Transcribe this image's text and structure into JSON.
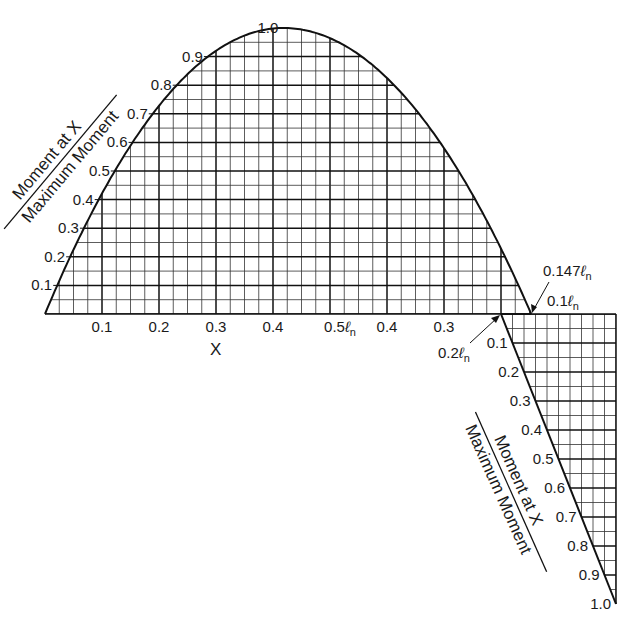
{
  "chart_data": {
    "type": "line",
    "title": "",
    "xlabel": "X",
    "ylabel": "Moment at X / Maximum Moment",
    "x_tick_labels": [
      "0.1",
      "0.2",
      "0.3",
      "0.4",
      "0.5ℓn",
      "0.4",
      "0.3"
    ],
    "y_tick_labels_positive": [
      "0.1",
      "0.2",
      "0.3",
      "0.4",
      "0.5",
      "0.6",
      "0.7",
      "0.8",
      "0.9",
      "1.0"
    ],
    "y_tick_labels_negative": [
      "0.1",
      "0.2",
      "0.3",
      "0.4",
      "0.5",
      "0.6",
      "0.7",
      "0.8",
      "0.9",
      "1.0"
    ],
    "annotations": [
      "0.147ℓn",
      "0.1ℓn",
      "0.2ℓn"
    ],
    "series": [
      {
        "name": "Positive moment",
        "x": [
          0,
          0.1,
          0.2,
          0.3,
          0.42,
          0.5,
          0.6,
          0.7,
          0.8,
          0.853
        ],
        "values": [
          0,
          0.38,
          0.68,
          0.89,
          1.0,
          0.96,
          0.83,
          0.6,
          0.3,
          0
        ]
      },
      {
        "name": "Negative moment",
        "x": [
          0.8,
          0.9,
          1.0
        ],
        "values": [
          0,
          -0.5,
          -1.0
        ]
      }
    ],
    "ylim": [
      -1.0,
      1.0
    ],
    "grid": true
  },
  "labels": {
    "x_axis": "X",
    "y_title_top": "Moment at X",
    "y_title_bottom": "Maximum Moment",
    "neg_title_top": "Moment at X",
    "neg_title_bottom": "Maximum Moment",
    "ann_0147": "0.147",
    "ann_01": "0.1",
    "ann_02": "0.2",
    "ln_symbol": "ℓ",
    "ln_sub": "n"
  }
}
